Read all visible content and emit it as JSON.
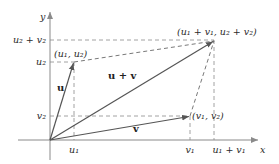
{
  "diagram": {
    "axes": {
      "x_label": "x",
      "y_label": "y"
    },
    "vectors": {
      "u": {
        "label": "u",
        "tip_label": "(u₁, u₂)"
      },
      "v": {
        "label": "v",
        "tip_label": "(v₁, v₂)"
      },
      "sum": {
        "label": "u + v",
        "tip_label": "(u₁ + v₁, u₂ + v₂)"
      }
    },
    "x_ticks": [
      "u₁",
      "v₁",
      "u₁ + v₁"
    ],
    "y_ticks": [
      "u₂ + v₂",
      "u₂",
      "v₂"
    ],
    "colors": {
      "axis": "#8a8a8a",
      "vector": "#555555",
      "dashed": "#8a8a8a",
      "text": "#2b2b2b"
    }
  }
}
